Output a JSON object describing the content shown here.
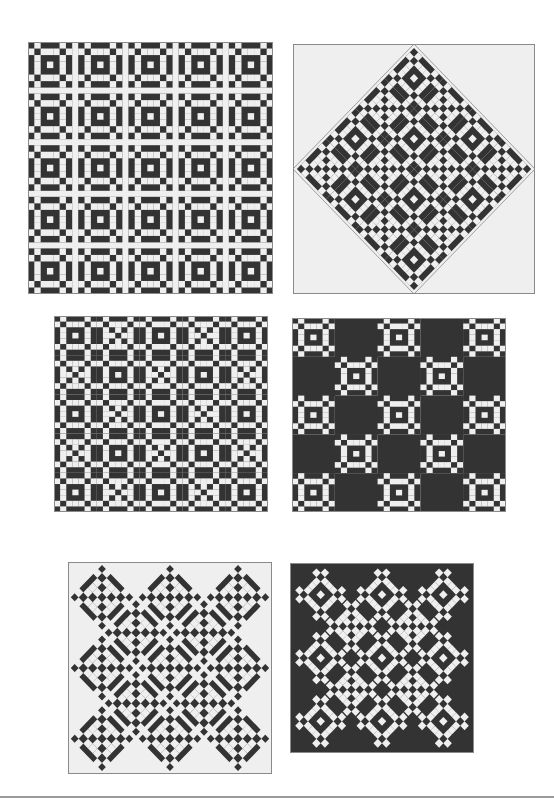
{
  "page": {
    "background": "#ffffff",
    "colors": {
      "dark": "#333333",
      "light": "#efefef",
      "border": "#8a8a8a"
    }
  },
  "block": {
    "grid": 7,
    "pattern_light_center": [
      "DLDDDLD",
      "LDLLLDL",
      "DLDDDLD",
      "DLDLDLD",
      "DLDDDLD",
      "LDLLLDL",
      "DLDDDLD"
    ],
    "note": "D = dark, L = light; 7x7 unit grid approximating the nine-patch-chain block"
  },
  "panels": [
    {
      "id": "p1",
      "layout": "grid-sashed",
      "x": 28,
      "y": 42,
      "w": 245,
      "h": 252,
      "rows": 5,
      "cols": 5,
      "sashing": true,
      "background": "light"
    },
    {
      "id": "p2",
      "layout": "on-point-diamond",
      "x": 293,
      "y": 44,
      "w": 242,
      "h": 250,
      "n": 4,
      "background": "light"
    },
    {
      "id": "p3",
      "layout": "grid-alternating",
      "x": 54,
      "y": 316,
      "w": 214,
      "h": 196,
      "rows": 5,
      "cols": 5,
      "background": "light"
    },
    {
      "id": "p4",
      "layout": "grid-with-solid",
      "x": 292,
      "y": 318,
      "w": 214,
      "h": 194,
      "rows": 5,
      "cols": 5,
      "background": "light"
    },
    {
      "id": "p5",
      "layout": "x-on-point-sashed",
      "x": 68,
      "y": 562,
      "w": 204,
      "h": 212,
      "background": "light"
    },
    {
      "id": "p6",
      "layout": "x-on-point-dark",
      "x": 290,
      "y": 563,
      "w": 184,
      "h": 190,
      "background": "dark"
    }
  ]
}
